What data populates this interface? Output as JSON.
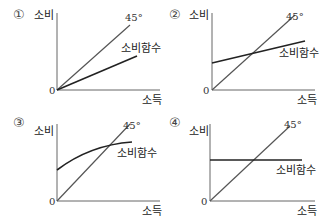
{
  "panels": [
    {
      "id": "1",
      "marker": "①",
      "ylabel": "소비",
      "xlabel": "소득",
      "origin": "0",
      "line45": "45°",
      "func_label": "소비함수",
      "func_shape": "linear through origin, slope < 1"
    },
    {
      "id": "2",
      "marker": "②",
      "ylabel": "소비",
      "xlabel": "소득",
      "origin": "0",
      "line45": "45°",
      "func_label": "소비함수",
      "func_shape": "linear with positive intercept, slope < 1"
    },
    {
      "id": "3",
      "marker": "③",
      "ylabel": "소비",
      "xlabel": "소득",
      "origin": "0",
      "line45": "45°",
      "func_label": "소비함수",
      "func_shape": "concave curve with positive intercept"
    },
    {
      "id": "4",
      "marker": "④",
      "ylabel": "소비",
      "xlabel": "소득",
      "origin": "0",
      "line45": "45°",
      "func_label": "소비함수",
      "func_shape": "horizontal line (constant consumption)"
    }
  ],
  "colors": {
    "line45": "#555555",
    "func": "#222222",
    "axis": "#666666"
  }
}
